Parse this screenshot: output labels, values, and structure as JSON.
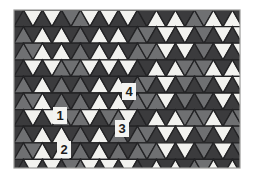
{
  "figure": {
    "kind": "geometric-tiling-diagram",
    "canvas": {
      "width": 253,
      "height": 180
    },
    "pattern_area": {
      "x": 14,
      "y": 10,
      "width": 226,
      "height": 158
    },
    "colors": {
      "background": "#ffffff",
      "white_tile": "#f2f2ef",
      "mid_gray_tile": "#6f7072",
      "dark_gray_tile": "#3b3b3d",
      "outline": "#232325",
      "border": "#9a9a98",
      "label_bg": "#f4f4f2",
      "label_text": "#1c1c1c"
    },
    "geometry": {
      "triangle_width": 19.0,
      "row_height": 16.6,
      "rows": 10,
      "cols": 13
    }
  },
  "labels": [
    {
      "id": "label-1",
      "text": "1",
      "x": 53,
      "y": 107,
      "w": 14,
      "h": 17
    },
    {
      "id": "label-2",
      "text": "2",
      "x": 57,
      "y": 141,
      "w": 14,
      "h": 17
    },
    {
      "id": "label-3",
      "text": "3",
      "x": 115,
      "y": 120,
      "w": 14,
      "h": 17
    },
    {
      "id": "label-4",
      "text": "4",
      "x": 122,
      "y": 83,
      "w": 14,
      "h": 17
    }
  ],
  "tile_rows": [
    "DWDWDMMWDWDWD",
    "MDWDWDMDWDWDM",
    "MMWDWDMDWDWDM",
    "DWDWMMMWDWDWD",
    "MDWDMDMDWDWDM",
    "MMWDMDMDWDWDM",
    "DWDWMMMWDMMWD",
    "MDWDWDMDWDMDM",
    "MMWDWDMDWDMDM",
    "DWDWDMMWDWDWD"
  ]
}
